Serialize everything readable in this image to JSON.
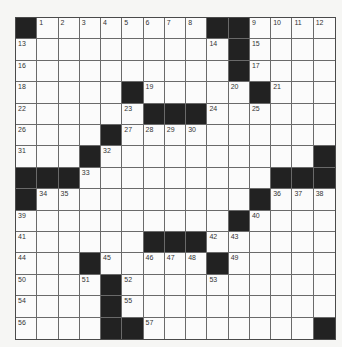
{
  "puzzle": {
    "rows": 15,
    "cols": 15,
    "colors": {
      "black_cell": "#222222",
      "white_cell": "#fbfbfb",
      "grid_line": "#6a6a6a",
      "background": "#f6f6f4"
    },
    "layout": [
      "#........##....",
      "..........#....",
      "..........#....",
      ".....#.....#...",
      "......###......",
      "....#..........",
      "...#..........#",
      "###.........###",
      "#..........#...",
      "..........#....",
      "......###......",
      "...#.....#.....",
      "....#..........",
      "....#..........",
      "....##........#"
    ],
    "numbers": [
      {
        "r": 0,
        "c": 1,
        "n": "1"
      },
      {
        "r": 0,
        "c": 2,
        "n": "2"
      },
      {
        "r": 0,
        "c": 3,
        "n": "3"
      },
      {
        "r": 0,
        "c": 4,
        "n": "4"
      },
      {
        "r": 0,
        "c": 5,
        "n": "5"
      },
      {
        "r": 0,
        "c": 6,
        "n": "6"
      },
      {
        "r": 0,
        "c": 7,
        "n": "7"
      },
      {
        "r": 0,
        "c": 8,
        "n": "8"
      },
      {
        "r": 0,
        "c": 11,
        "n": "9"
      },
      {
        "r": 0,
        "c": 12,
        "n": "10"
      },
      {
        "r": 0,
        "c": 13,
        "n": "11"
      },
      {
        "r": 0,
        "c": 14,
        "n": "12"
      },
      {
        "r": 1,
        "c": 0,
        "n": "13"
      },
      {
        "r": 1,
        "c": 9,
        "n": "14"
      },
      {
        "r": 1,
        "c": 11,
        "n": "15"
      },
      {
        "r": 2,
        "c": 0,
        "n": "16"
      },
      {
        "r": 2,
        "c": 11,
        "n": "17"
      },
      {
        "r": 3,
        "c": 0,
        "n": "18"
      },
      {
        "r": 3,
        "c": 6,
        "n": "19"
      },
      {
        "r": 3,
        "c": 10,
        "n": "20"
      },
      {
        "r": 3,
        "c": 12,
        "n": "21"
      },
      {
        "r": 4,
        "c": 0,
        "n": "22"
      },
      {
        "r": 4,
        "c": 5,
        "n": "23"
      },
      {
        "r": 4,
        "c": 9,
        "n": "24"
      },
      {
        "r": 4,
        "c": 11,
        "n": "25"
      },
      {
        "r": 5,
        "c": 0,
        "n": "26"
      },
      {
        "r": 5,
        "c": 5,
        "n": "27"
      },
      {
        "r": 5,
        "c": 6,
        "n": "28"
      },
      {
        "r": 5,
        "c": 7,
        "n": "29"
      },
      {
        "r": 5,
        "c": 8,
        "n": "30"
      },
      {
        "r": 6,
        "c": 0,
        "n": "31"
      },
      {
        "r": 6,
        "c": 4,
        "n": "32"
      },
      {
        "r": 7,
        "c": 3,
        "n": "33"
      },
      {
        "r": 8,
        "c": 1,
        "n": "34"
      },
      {
        "r": 8,
        "c": 2,
        "n": "35"
      },
      {
        "r": 8,
        "c": 12,
        "n": "36"
      },
      {
        "r": 8,
        "c": 13,
        "n": "37"
      },
      {
        "r": 8,
        "c": 14,
        "n": "38"
      },
      {
        "r": 9,
        "c": 0,
        "n": "39"
      },
      {
        "r": 9,
        "c": 11,
        "n": "40"
      },
      {
        "r": 10,
        "c": 0,
        "n": "41"
      },
      {
        "r": 10,
        "c": 9,
        "n": "42"
      },
      {
        "r": 10,
        "c": 10,
        "n": "43"
      },
      {
        "r": 11,
        "c": 0,
        "n": "44"
      },
      {
        "r": 11,
        "c": 4,
        "n": "45"
      },
      {
        "r": 11,
        "c": 6,
        "n": "46"
      },
      {
        "r": 11,
        "c": 7,
        "n": "47"
      },
      {
        "r": 11,
        "c": 8,
        "n": "48"
      },
      {
        "r": 11,
        "c": 10,
        "n": "49"
      },
      {
        "r": 12,
        "c": 0,
        "n": "50"
      },
      {
        "r": 12,
        "c": 3,
        "n": "51"
      },
      {
        "r": 12,
        "c": 5,
        "n": "52"
      },
      {
        "r": 12,
        "c": 9,
        "n": "53"
      },
      {
        "r": 13,
        "c": 0,
        "n": "54"
      },
      {
        "r": 13,
        "c": 5,
        "n": "55"
      },
      {
        "r": 14,
        "c": 0,
        "n": "56"
      },
      {
        "r": 14,
        "c": 6,
        "n": "57"
      }
    ]
  }
}
